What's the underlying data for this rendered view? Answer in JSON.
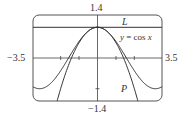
{
  "chart_data": {
    "type": "line",
    "title": "",
    "xlabel": "",
    "ylabel": "",
    "xlim": [
      -3.5,
      3.5
    ],
    "ylim": [
      -1.4,
      1.4
    ],
    "grid": false,
    "tick_labels": {
      "x_left": "−3.5",
      "x_right": "3.5",
      "y_top": "1.4",
      "y_bottom": "−1.4"
    },
    "series": [
      {
        "name": "y = cos x",
        "function": "cos(x)",
        "label": "y = cos x"
      },
      {
        "name": "L",
        "function": "1",
        "label": "L"
      },
      {
        "name": "P",
        "function": "1 - x^2/2",
        "label": "P"
      }
    ],
    "annotations": [
      {
        "text": "L",
        "near": "horizontal line y = 1, right side"
      },
      {
        "text": "y = cos x",
        "near": "upper right below L"
      },
      {
        "text": "P",
        "near": "lower right inside parabola"
      }
    ],
    "colors": {
      "curve": "#333333",
      "frame": "#555555",
      "axis": "#444444"
    }
  },
  "labels": {
    "y_top": "1.4",
    "y_bottom": "−1.4",
    "x_left": "−3.5",
    "x_right": "3.5",
    "L": "L",
    "cos_y": "y",
    "cos_eq": " = cos ",
    "cos_x": "x",
    "P": "P"
  }
}
